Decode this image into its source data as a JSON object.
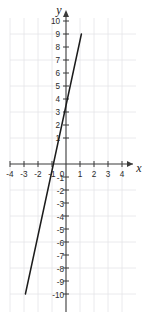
{
  "figure": {
    "kind": "coordinate-plane-line-graph",
    "background_color": "#ffffff",
    "grid_color": "#e2e2e6",
    "axis_color": "#3a3a3a",
    "line_color": "#1c1c1c",
    "tick_text_color": "#2b2b2b"
  },
  "axes": {
    "x_axis_label": "x",
    "y_axis_label": "y",
    "x_ticks": [
      "-4",
      "-3",
      "-2",
      "-1",
      "0",
      "1",
      "2",
      "3",
      "4"
    ],
    "y_ticks_positive": [
      "10",
      "9",
      "8",
      "7",
      "6",
      "5",
      "4",
      "3",
      "2",
      "1"
    ],
    "y_ticks_negative": [
      "-1",
      "-2",
      "-3",
      "-4",
      "-5",
      "-6",
      "-7",
      "-8",
      "-9",
      "-10"
    ],
    "origin_label": "0"
  },
  "chart_data": {
    "type": "line",
    "title": "",
    "xlabel": "x",
    "ylabel": "y",
    "xlim": [
      -4,
      4
    ],
    "ylim": [
      -10,
      10
    ],
    "xticks": [
      -4,
      -3,
      -2,
      -1,
      0,
      1,
      2,
      3,
      4
    ],
    "yticks": [
      -10,
      -9,
      -8,
      -7,
      -6,
      -5,
      -4,
      -3,
      -2,
      -1,
      0,
      1,
      2,
      3,
      4,
      5,
      6,
      7,
      8,
      9,
      10
    ],
    "grid": true,
    "grid_x_step": 1,
    "grid_y_step": 2,
    "legend": null,
    "series": [
      {
        "name": "line",
        "equation": "y = 5x + 4.5",
        "slope": 5,
        "y_intercept": 4.5,
        "x_intercept": -0.9,
        "points": [
          {
            "x": -2.9,
            "y": -10
          },
          {
            "x": -0.9,
            "y": 0
          },
          {
            "x": 0,
            "y": 4.5
          },
          {
            "x": 1.1,
            "y": 10
          }
        ]
      }
    ]
  }
}
